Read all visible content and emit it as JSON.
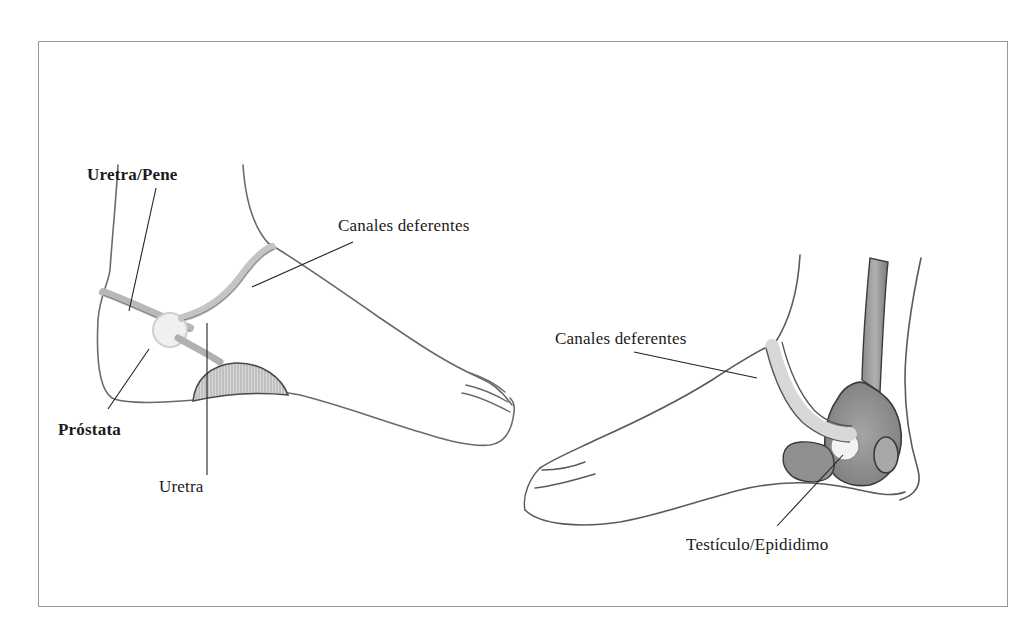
{
  "figure": {
    "left_foot": {
      "labels": {
        "urethra_penis": "Uretra/Pene",
        "vas_deferens": "Canales deferentes",
        "prostate": "Próstata",
        "urethra": "Uretra"
      }
    },
    "right_foot": {
      "labels": {
        "vas_deferens": "Canales deferentes",
        "testicle_epididymis": "Testículo/Epididimo"
      }
    }
  }
}
